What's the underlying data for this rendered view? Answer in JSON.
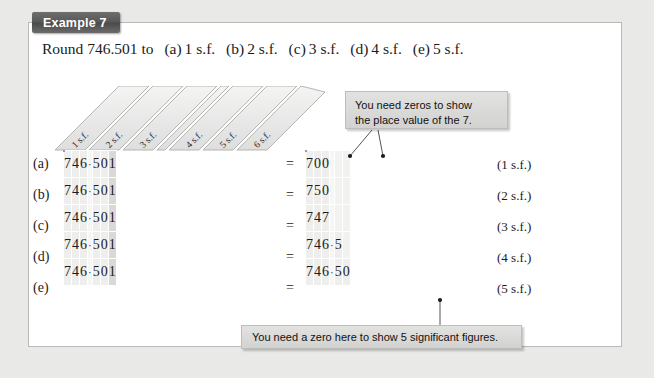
{
  "banner": {
    "label": "Example 7"
  },
  "prompt": {
    "lead": "Round 746.501 to",
    "options": [
      {
        "label": "(a)",
        "text": "1 s.f."
      },
      {
        "label": "(b)",
        "text": "2 s.f."
      },
      {
        "label": "(c)",
        "text": "3 s.f."
      },
      {
        "label": "(d)",
        "text": "4 s.f."
      },
      {
        "label": "(e)",
        "text": "5 s.f."
      }
    ]
  },
  "column_headers": [
    "1 s.f.",
    "2 s.f.",
    "3 s.f.",
    "4 s.f.",
    "5 s.f.",
    "6 s.f."
  ],
  "row_labels": [
    "(a)",
    "(b)",
    "(c)",
    "(d)",
    "(e)"
  ],
  "equals": [
    "=",
    "=",
    "=",
    "=",
    "="
  ],
  "decimal_point": "·",
  "left_table": {
    "rows": [
      [
        "7",
        "4",
        "6",
        "·",
        "5",
        "0",
        "1"
      ],
      [
        "7",
        "4",
        "6",
        "·",
        "5",
        "0",
        "1"
      ],
      [
        "7",
        "4",
        "6",
        "·",
        "5",
        "0",
        "1"
      ],
      [
        "7",
        "4",
        "6",
        "·",
        "5",
        "0",
        "1"
      ],
      [
        "7",
        "4",
        "6",
        "·",
        "5",
        "0",
        "1"
      ]
    ]
  },
  "right_table": {
    "rows": [
      [
        "7",
        "0",
        "0",
        "",
        "",
        "",
        ""
      ],
      [
        "7",
        "5",
        "0",
        "",
        "",
        "",
        ""
      ],
      [
        "7",
        "4",
        "7",
        "",
        "",
        "",
        ""
      ],
      [
        "7",
        "4",
        "6",
        "·",
        "5",
        "",
        ""
      ],
      [
        "7",
        "4",
        "6",
        "·",
        "5",
        "0",
        ""
      ]
    ]
  },
  "result_labels": [
    "(1 s.f.)",
    "(2 s.f.)",
    "(3 s.f.)",
    "(4 s.f.)",
    "(5 s.f.)"
  ],
  "callouts": {
    "top_line1": "You need zeros to show",
    "top_line2": "the place value of the 7.",
    "bottom": "You need a zero here to show 5 significant figures."
  },
  "colors": {
    "page_background": "#e9e9e7",
    "box_background": "#ffffff",
    "box_border": "#b9b9b7",
    "banner_dark": "#575757",
    "cell_fill": "#eeeeec",
    "cell_shade": "#d9d9d7",
    "callout_fill": "#d8d8d6",
    "text": "#1b1b1b"
  }
}
